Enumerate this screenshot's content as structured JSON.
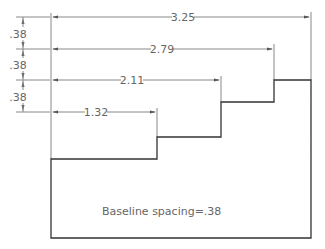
{
  "dimensions": {
    "horizontal": [
      {
        "label": "3.25"
      },
      {
        "label": "2.79"
      },
      {
        "label": "2.11"
      },
      {
        "label": "1.32"
      }
    ],
    "vertical": [
      {
        "label": ".38"
      },
      {
        "label": ".38"
      },
      {
        "label": ".38"
      }
    ]
  },
  "note": "Baseline spacing=.38",
  "colors": {
    "outline": "#333333",
    "dim": "#777777",
    "text": "#666666"
  }
}
